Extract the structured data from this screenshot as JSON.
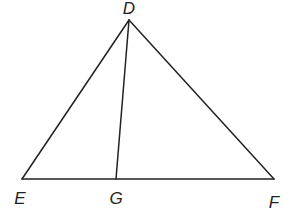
{
  "diagram": {
    "type": "triangle",
    "points": {
      "D": {
        "label": "D",
        "x": 129,
        "y": 20,
        "lx": 129,
        "ly": 14
      },
      "E": {
        "label": "E",
        "x": 22,
        "y": 179,
        "lx": 20,
        "ly": 204
      },
      "G": {
        "label": "G",
        "x": 116,
        "y": 179,
        "lx": 116,
        "ly": 204
      },
      "F": {
        "label": "F",
        "x": 274,
        "y": 179,
        "lx": 274,
        "ly": 208
      }
    },
    "segments": [
      {
        "from": "D",
        "to": "E"
      },
      {
        "from": "D",
        "to": "F"
      },
      {
        "from": "E",
        "to": "F"
      },
      {
        "from": "D",
        "to": "G"
      }
    ]
  }
}
